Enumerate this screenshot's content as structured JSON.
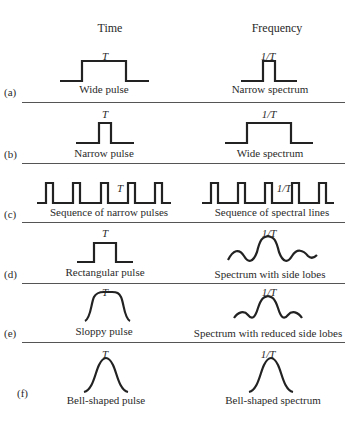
{
  "headers": {
    "time": "Time",
    "frequency": "Frequency"
  },
  "rows": [
    {
      "tag": "(a)",
      "time_label": "T",
      "time_caption": "Wide pulse",
      "freq_label": "1/T",
      "freq_caption": "Narrow spectrum"
    },
    {
      "tag": "(b)",
      "time_label": "T",
      "time_caption": "Narrow pulse",
      "freq_label": "1/T",
      "freq_caption": "Wide spectrum"
    },
    {
      "tag": "(c)",
      "time_label": "T",
      "time_caption": "Sequence of narrow pulses",
      "freq_label": "1/T",
      "freq_caption": "Sequence of spectral lines"
    },
    {
      "tag": "(d)",
      "time_label": "T",
      "time_caption": "Rectangular pulse",
      "freq_label": "1/T",
      "freq_caption": "Spectrum with side lobes"
    },
    {
      "tag": "(e)",
      "time_label": "T",
      "time_caption": "Sloppy pulse",
      "freq_label": "1/T",
      "freq_caption": "Spectrum with reduced side lobes"
    },
    {
      "tag": "(f)",
      "time_label": "T",
      "time_caption": "Bell-shaped pulse",
      "freq_label": "1/T",
      "freq_caption": "Bell-shaped spectrum"
    }
  ],
  "colors": {
    "line": "#222222",
    "background": "#ffffff"
  }
}
